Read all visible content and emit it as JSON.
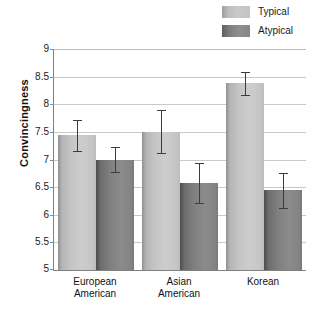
{
  "chart_data": {
    "type": "bar",
    "title": "",
    "xlabel": "",
    "ylabel": "Convincingness",
    "ylim": [
      5,
      9
    ],
    "ytick_step": 0.5,
    "yticks": [
      "9",
      "8.5",
      "8",
      "7.5",
      "7",
      "6.5",
      "6",
      "5.5",
      "5"
    ],
    "grid": "horizontal",
    "legend_position": "top-right",
    "categories": [
      "European American",
      "Asian American",
      "Korean"
    ],
    "category_lines": [
      [
        "European",
        "American"
      ],
      [
        "Asian",
        "American"
      ],
      [
        "Korean"
      ]
    ],
    "series": [
      {
        "name": "Typical",
        "color": "#c6c6c6",
        "values": [
          7.44,
          7.5,
          8.38
        ],
        "errors": [
          0.28,
          0.39,
          0.21
        ]
      },
      {
        "name": "Atypical",
        "color": "#7f7f7f",
        "values": [
          7.0,
          6.57,
          6.44
        ],
        "errors": [
          0.23,
          0.36,
          0.31
        ]
      }
    ]
  },
  "legend": {
    "items": [
      {
        "label": "Typical",
        "swatch": "typical-swatch"
      },
      {
        "label": "Atypical",
        "swatch": "atypical-swatch"
      }
    ]
  },
  "axis": {
    "y_title": "Convincingness"
  }
}
